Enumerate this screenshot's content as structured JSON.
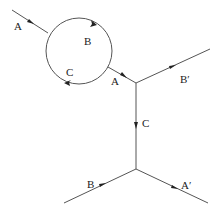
{
  "diagram": {
    "type": "feynman-style particle line diagram",
    "labels": {
      "incoming_a": "A",
      "loop_b": "B",
      "loop_c": "C",
      "outgoing_a": "A",
      "outgoing_b_prime": "B′",
      "propagator_c": "C",
      "incoming_b": "B",
      "outgoing_a_prime": "A′"
    },
    "colors": {
      "line": "#555555",
      "arrow": "#222222",
      "text": "#222222"
    }
  }
}
